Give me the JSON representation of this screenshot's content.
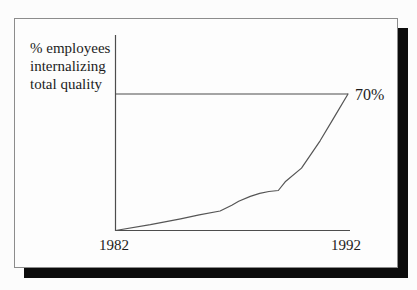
{
  "figure": {
    "background_color": "#fcfcfc",
    "card_color": "#fdfdfd",
    "card_border_color": "#8c8c8c",
    "shadow_color": "#0c0c0c",
    "line_color": "#4d4d4d",
    "text_color": "#1c1c1c"
  },
  "chart_data": {
    "type": "line",
    "title": "",
    "ylabel": "% employees internalizing total quality",
    "ylabel_lines": [
      "% employees",
      "internalizing",
      "total quality"
    ],
    "xlabel": "",
    "x_tick_labels": [
      "1982",
      "1992"
    ],
    "x_range": [
      1982,
      1992
    ],
    "y_range": [
      0,
      70
    ],
    "grid": false,
    "legend": false,
    "reference_line": {
      "y": 70,
      "label": "70%"
    },
    "series": [
      {
        "name": "% employees internalizing total quality",
        "points": [
          [
            1982,
            0
          ],
          [
            1983.5,
            3
          ],
          [
            1984.8,
            6
          ],
          [
            1985.6,
            8
          ],
          [
            1986.5,
            10
          ],
          [
            1987,
            13
          ],
          [
            1987.3,
            15
          ],
          [
            1987.8,
            17.5
          ],
          [
            1988.2,
            19
          ],
          [
            1988.6,
            20
          ],
          [
            1989,
            20.5
          ],
          [
            1989.3,
            25
          ],
          [
            1990,
            32
          ],
          [
            1990.8,
            46
          ],
          [
            1991.4,
            58
          ],
          [
            1992,
            70
          ]
        ]
      }
    ]
  }
}
